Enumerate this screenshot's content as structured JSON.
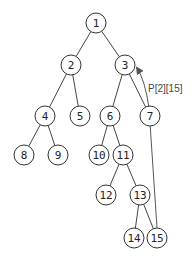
{
  "diagram": {
    "type": "binary-tree",
    "nodes": [
      {
        "id": "1",
        "label": "1",
        "x": 96,
        "y": 23
      },
      {
        "id": "2",
        "label": "2",
        "x": 71,
        "y": 65
      },
      {
        "id": "3",
        "label": "3",
        "x": 125,
        "y": 65
      },
      {
        "id": "4",
        "label": "4",
        "x": 45,
        "y": 116
      },
      {
        "id": "5",
        "label": "5",
        "x": 80,
        "y": 116
      },
      {
        "id": "6",
        "label": "6",
        "x": 110,
        "y": 116
      },
      {
        "id": "7",
        "label": "7",
        "x": 150,
        "y": 116
      },
      {
        "id": "8",
        "label": "8",
        "x": 24,
        "y": 155
      },
      {
        "id": "9",
        "label": "9",
        "x": 58,
        "y": 155
      },
      {
        "id": "10",
        "label": "10",
        "x": 99,
        "y": 155
      },
      {
        "id": "11",
        "label": "11",
        "x": 123,
        "y": 155
      },
      {
        "id": "12",
        "label": "12",
        "x": 106,
        "y": 195
      },
      {
        "id": "13",
        "label": "13",
        "x": 140,
        "y": 195
      },
      {
        "id": "14",
        "label": "14",
        "x": 134,
        "y": 238
      },
      {
        "id": "15",
        "label": "15",
        "x": 157,
        "y": 238
      }
    ],
    "edges": [
      [
        "1",
        "2"
      ],
      [
        "1",
        "3"
      ],
      [
        "2",
        "4"
      ],
      [
        "2",
        "5"
      ],
      [
        "3",
        "6"
      ],
      [
        "3",
        "7"
      ],
      [
        "4",
        "8"
      ],
      [
        "4",
        "9"
      ],
      [
        "6",
        "10"
      ],
      [
        "6",
        "11"
      ],
      [
        "11",
        "12"
      ],
      [
        "11",
        "13"
      ],
      [
        "13",
        "14"
      ],
      [
        "13",
        "15"
      ]
    ],
    "pointer": {
      "from": "15",
      "to": "3",
      "label": "P[2][15]",
      "label_x": 148,
      "label_y": 92
    }
  }
}
